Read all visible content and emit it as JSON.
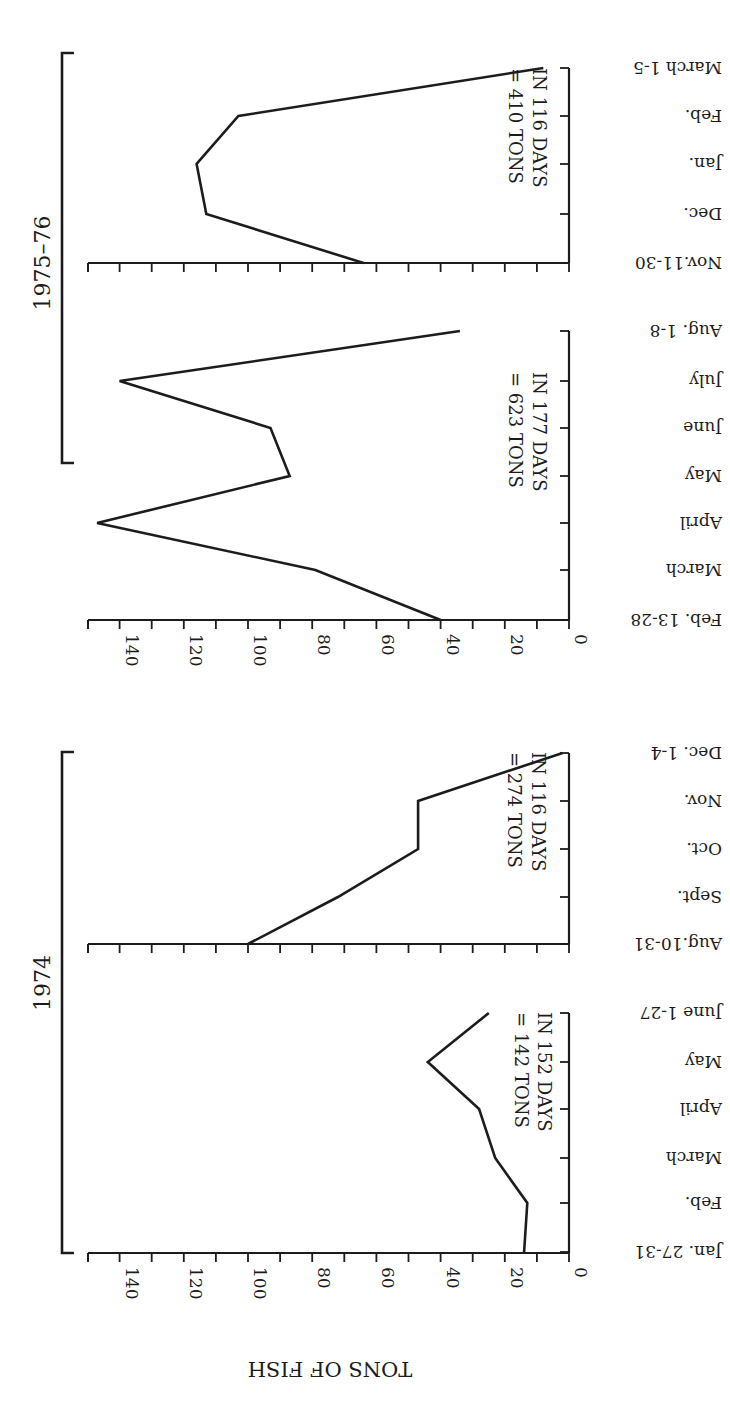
{
  "figure": {
    "ylabel": "TONS OF FISH",
    "orientation_note_visible": false
  },
  "groups": [
    {
      "label": "1974",
      "panels": [
        0,
        1
      ]
    },
    {
      "label": "1975–76",
      "panels": [
        2,
        3
      ]
    }
  ],
  "chart_data": [
    {
      "type": "line",
      "group": "1974",
      "categories": [
        "Jan. 27-31",
        "Feb.",
        "March",
        "April",
        "May",
        "June 1-27"
      ],
      "values": [
        14,
        13,
        23,
        28,
        44,
        25
      ],
      "annotation": [
        "= 142 TONS",
        "IN 152 DAYS"
      ],
      "ylabel": "TONS OF FISH",
      "ylim": [
        0,
        150
      ],
      "yticks": [
        0,
        20,
        40,
        60,
        80,
        100,
        120,
        140
      ],
      "grid": false
    },
    {
      "type": "line",
      "group": "1974",
      "categories": [
        "Aug.10-31",
        "Sept.",
        "Oct.",
        "Nov.",
        "Dec. 1-4"
      ],
      "values": [
        100,
        72,
        47,
        47,
        2
      ],
      "annotation": [
        "= 274 TONS",
        "IN 116 DAYS"
      ],
      "ylabel": "TONS OF FISH",
      "ylim": [
        0,
        150
      ],
      "grid": false
    },
    {
      "type": "line",
      "group": "1975–76",
      "categories": [
        "Feb. 13-28",
        "March",
        "April",
        "May",
        "June",
        "July",
        "Aug. 1-8"
      ],
      "values": [
        40,
        79,
        147,
        87,
        93,
        140,
        34
      ],
      "annotation": [
        "= 623 TONS",
        "IN 177 DAYS"
      ],
      "ylabel": "TONS OF FISH",
      "ylim": [
        0,
        150
      ],
      "yticks": [
        0,
        20,
        40,
        60,
        80,
        100,
        120,
        140
      ],
      "grid": false
    },
    {
      "type": "line",
      "group": "1975–76",
      "categories": [
        "Nov.11-30",
        "Dec.",
        "Jan.",
        "Feb.",
        "March 1-5"
      ],
      "values": [
        64,
        113,
        116,
        103,
        8
      ],
      "annotation": [
        "= 410 TONS",
        "IN 116 DAYS"
      ],
      "ylabel": "TONS OF FISH",
      "ylim": [
        0,
        150
      ],
      "grid": false
    }
  ],
  "colors": {
    "ink": "#1c1c1c",
    "background": "#ffffff"
  }
}
